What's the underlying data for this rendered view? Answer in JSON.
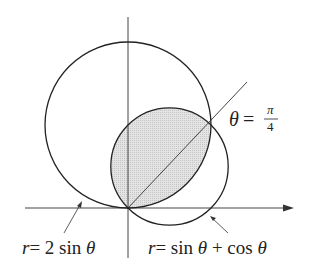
{
  "diagram": {
    "type": "polar-curves-region",
    "curves": [
      {
        "name": "large-circle",
        "equation_label": "r = 2 sin θ",
        "label_r": "r",
        "label_eq": "= 2 sin ",
        "label_theta": "θ"
      },
      {
        "name": "small-circle",
        "equation_label": "r = sin θ + cos θ",
        "label_r": "r",
        "label_eq1": "= sin ",
        "label_theta1": "θ",
        "label_eq2": " + cos ",
        "label_theta2": "θ"
      }
    ],
    "ray": {
      "label_theta": "θ",
      "label_eq": "=",
      "numerator": "π",
      "denominator": "4"
    },
    "shaded_region": "intersection of both circles",
    "colors": {
      "stroke": "#222222",
      "fill": "#d8d8d8",
      "axis": "#444444"
    }
  }
}
